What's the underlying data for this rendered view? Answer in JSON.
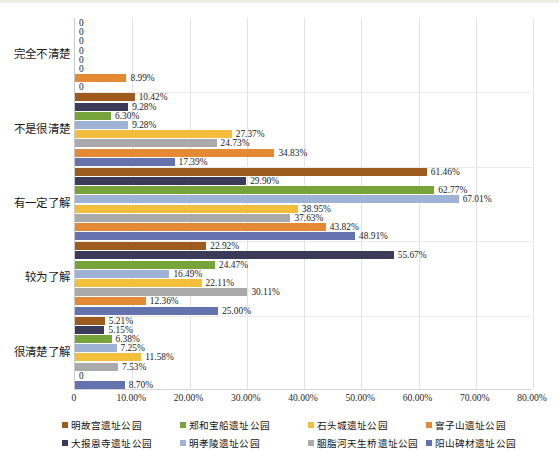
{
  "chart_data": {
    "type": "bar",
    "orientation": "horizontal",
    "title": "",
    "subtitle": "",
    "xlabel": "",
    "ylabel": "",
    "xlim": [
      0,
      80
    ],
    "xtick_labels": [
      "0",
      "10.00%",
      "20.00%",
      "30.00%",
      "40.00%",
      "50.00%",
      "60.00%",
      "70.00%",
      "80.00%"
    ],
    "xtick_values": [
      0,
      10,
      20,
      30,
      40,
      50,
      60,
      70,
      80
    ],
    "grid": true,
    "legend_position": "bottom",
    "categories": [
      "完全不清楚",
      "不是很清楚",
      "有一定了解",
      "较为了解",
      "很清楚了解"
    ],
    "series": [
      {
        "name": "明故宫遗址公园",
        "color": "#9E5B1F",
        "values": [
          0,
          10.42,
          61.46,
          22.92,
          5.21
        ],
        "labels": [
          "0",
          "10.42%",
          "61.46%",
          "22.92%",
          "5.21%"
        ]
      },
      {
        "name": "大报恩寺遗址公园",
        "color": "#3B3B59",
        "values": [
          0,
          9.28,
          29.9,
          55.67,
          5.15
        ],
        "labels": [
          "0",
          "9.28%",
          "29.90%",
          "55.67%",
          "5.15%"
        ]
      },
      {
        "name": "郑和宝船遗址公园",
        "color": "#77A33B",
        "values": [
          0,
          6.3,
          62.77,
          24.47,
          6.38
        ],
        "labels": [
          "0",
          "6.30%",
          "62.77%",
          "24.47%",
          "6.38%"
        ]
      },
      {
        "name": "明孝陵遗址公园",
        "color": "#9DB2D4",
        "values": [
          0,
          9.28,
          67.01,
          16.49,
          7.25
        ],
        "labels": [
          "0",
          "9.28%",
          "67.01%",
          "16.49%",
          "7.25%"
        ]
      },
      {
        "name": "石头城遗址公园",
        "color": "#F2BE3C",
        "values": [
          0,
          27.37,
          38.95,
          22.11,
          11.58
        ],
        "labels": [
          "0",
          "27.37%",
          "38.95%",
          "22.11%",
          "11.58%"
        ]
      },
      {
        "name": "胭脂河天生桥遗址公园",
        "color": "#AAAAAA",
        "values": [
          0,
          24.73,
          37.63,
          30.11,
          7.53
        ],
        "labels": [
          "0",
          "24.73%",
          "37.63%",
          "30.11%",
          "7.53%"
        ]
      },
      {
        "name": "窨子山遗址公园",
        "color": "#E58A34",
        "values": [
          8.99,
          34.83,
          43.82,
          12.36,
          0
        ],
        "labels": [
          "8.99%",
          "34.83%",
          "43.82%",
          "12.36%",
          "0"
        ]
      },
      {
        "name": "阳山碑材遗址公园",
        "color": "#6472AE",
        "values": [
          0,
          17.39,
          48.91,
          25.0,
          8.7
        ],
        "labels": [
          "0",
          "17.39%",
          "48.91%",
          "25.00%",
          "8.70%"
        ]
      }
    ]
  }
}
